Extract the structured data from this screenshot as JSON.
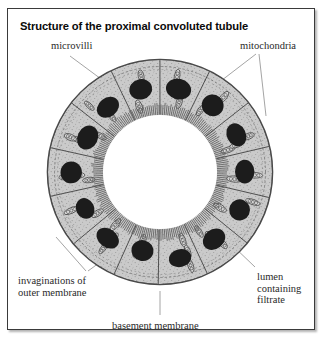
{
  "figure": {
    "title": "Structure of the proximal convoluted tubule",
    "labels": {
      "microvilli": "microvilli",
      "mitochondria": "mitochondria",
      "invaginations_line1": "invaginations of",
      "invaginations_line2": "outer membrane",
      "lumen_line1": "lumen",
      "lumen_line2": "containing",
      "lumen_line3": "filtrate",
      "basement_membrane": "basement membrane"
    },
    "colors": {
      "panel_border": "#3a3a3a",
      "background": "#ffffff",
      "cytoplasm": "#c9c9c9",
      "basement_membrane": "#4a4a4a",
      "nucleus": "#1c1c1c",
      "mitochondria_outline": "#3f3f3f",
      "mitochondria_fill": "#d8d8d8",
      "microvilli": "#666666",
      "lumen": "#ffffff",
      "leader_line": "#8d8d8d",
      "title_text": "#0a0a0a",
      "label_text": "#2a2a2a"
    },
    "diagram": {
      "type": "cross-section",
      "subject": "proximal convoluted tubule",
      "cell_count": 14,
      "nucleus_count": 14,
      "center_x": 152,
      "center_y": 163,
      "outer_radius": 112,
      "inner_radius": 58,
      "structures": [
        "basement membrane",
        "outer membrane invaginations",
        "epithelial cell cytoplasm",
        "nuclei",
        "mitochondria",
        "microvilli brush border",
        "lumen containing filtrate"
      ]
    }
  }
}
